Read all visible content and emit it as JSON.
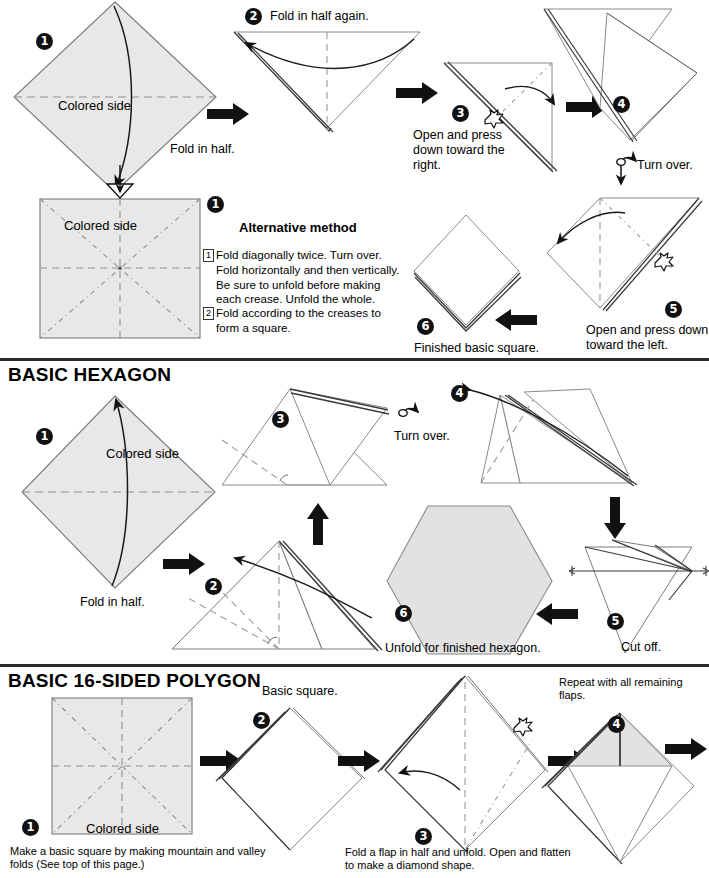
{
  "document": {
    "kind": "origami-instruction-sheet",
    "page_width": 709,
    "page_height": 878
  },
  "colors": {
    "paper_fill": "#e8e8e8",
    "paper_stroke": "#6e6e6e",
    "white_fill": "#ffffff",
    "line": "#3a3a3a",
    "crease": "#8a8a8a",
    "arrow": "#111111",
    "step_badge_bg": "#111111",
    "step_badge_fg": "#ffffff",
    "divider": "#2a2a2a"
  },
  "sections": [
    {
      "id": "basic-square",
      "title": "",
      "steps": [
        {
          "num": "1",
          "label": "Colored side",
          "caption": "Fold in half."
        },
        {
          "num": "2",
          "caption": "Fold in half again."
        },
        {
          "num": "3",
          "caption": "Open and press\ndown toward the\nright."
        },
        {
          "num": "4",
          "caption": "Turn over."
        },
        {
          "num": "5",
          "caption": "Open and press down\ntoward the left."
        },
        {
          "num": "6",
          "caption": "Finished basic square."
        }
      ],
      "alternative": {
        "heading": "Alternative method",
        "step_marks": [
          "1",
          "2"
        ],
        "body_1": "Fold diagonally twice. Turn over.\nFold horizontally and then vertically.\nBe sure to unfold before making\neach crease. Unfold the whole.",
        "body_2": "Fold according to the creases to\nform a square.",
        "diagram_step": "1",
        "diagram_label": "Colored side"
      }
    },
    {
      "id": "basic-hexagon",
      "title": "BASIC HEXAGON",
      "steps": [
        {
          "num": "1",
          "label": "Colored side",
          "caption": "Fold in half."
        },
        {
          "num": "2",
          "caption": ""
        },
        {
          "num": "3",
          "caption": ""
        },
        {
          "num": "4",
          "caption": "Turn over."
        },
        {
          "num": "5",
          "caption": "Cut off."
        },
        {
          "num": "6",
          "caption": "Unfold for finished hexagon."
        }
      ]
    },
    {
      "id": "basic-16-sided-polygon",
      "title": "BASIC 16-SIDED POLYGON",
      "steps": [
        {
          "num": "1",
          "label": "Colored side",
          "caption": "Make a basic square by making mountain and valley\nfolds (See top of this page.)"
        },
        {
          "num": "2",
          "caption": "Basic square."
        },
        {
          "num": "3",
          "caption": "Fold a flap in half and unfold. Open and flatten\nto make a diamond shape."
        },
        {
          "num": "4",
          "caption": "Repeat with all remaining\nflaps."
        }
      ]
    }
  ],
  "turn_over_labels": [
    "Turn over.",
    "Turn over."
  ],
  "icons": {
    "press_here": "pointing-hand-icon",
    "turn_over": "turn-over-loop-icon",
    "process_arrow": "solid-arrow-icon",
    "fold_arrow": "curved-fold-arrow-icon",
    "cut_line": "cut-line-icon"
  }
}
